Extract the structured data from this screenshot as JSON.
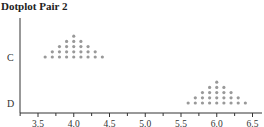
{
  "title": "Dotplot Pair 2",
  "chart_data": {
    "type": "scatter",
    "subtype": "dotplot",
    "title": "Dotplot Pair 2",
    "xlabel": "",
    "ylabel": "",
    "xlim": [
      3.25,
      6.6
    ],
    "xticks": [
      3.5,
      4.0,
      4.5,
      5.0,
      5.5,
      6.0,
      6.5
    ],
    "xtick_labels": [
      "3.5",
      "4.0",
      "4.5",
      "5.0",
      "5.5",
      "6.0",
      "6.5"
    ],
    "minor_tick_step": 0.25,
    "categories": [
      "C",
      "D"
    ],
    "grid": false,
    "legend": "none",
    "dot_color": "#999999",
    "series": [
      {
        "name": "C",
        "counts": {
          "3.6": 1,
          "3.7": 2,
          "3.8": 3,
          "3.9": 4,
          "4.0": 5,
          "4.1": 4,
          "4.2": 3,
          "4.3": 2,
          "4.4": 1
        }
      },
      {
        "name": "D",
        "counts": {
          "5.6": 1,
          "5.7": 2,
          "5.8": 3,
          "5.9": 4,
          "6.0": 5,
          "6.1": 4,
          "6.2": 3,
          "6.3": 2,
          "6.4": 1
        }
      }
    ]
  }
}
